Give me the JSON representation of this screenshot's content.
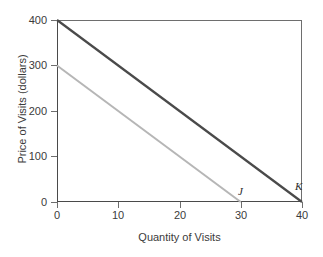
{
  "chart_data": {
    "type": "line",
    "title": "",
    "xlabel": "Quantity of Visits",
    "ylabel": "Price of Visits (dollars)",
    "xlim": [
      0,
      40
    ],
    "ylim": [
      0,
      400
    ],
    "xticks": [
      0,
      10,
      20,
      30,
      40
    ],
    "yticks": [
      0,
      100,
      200,
      300,
      400
    ],
    "xtick_labels": [
      "0",
      "10",
      "20",
      "30",
      "40"
    ],
    "ytick_labels": [
      "0",
      "100",
      "200",
      "300",
      "400"
    ],
    "grid": false,
    "legend": "none",
    "frame": "full-box",
    "series": [
      {
        "name": "K",
        "label": "K",
        "color": "#4a4a4a",
        "width": 2.2,
        "x": [
          0,
          40
        ],
        "y": [
          400,
          0
        ],
        "label_x": 40,
        "label_y": 0,
        "description": "Demand curve K: intercept 400 at quantity 0, reaches 0 at quantity 40"
      },
      {
        "name": "J",
        "label": "J",
        "color": "#b6b6b6",
        "width": 2.0,
        "x": [
          0,
          30
        ],
        "y": [
          300,
          0
        ],
        "label_x": 30,
        "label_y": 0,
        "description": "Demand curve J: intercept 300 at quantity 0, reaches 0 at quantity 30"
      }
    ],
    "annotations": [
      {
        "text": "J",
        "x": 30,
        "y": 0,
        "style": "italic"
      },
      {
        "text": "K",
        "x": 40,
        "y": 0,
        "style": "italic"
      }
    ],
    "colors": {
      "axis": "#6e6e6e",
      "text": "#3b3b3b",
      "background": "#ffffff",
      "series_k": "#4a4a4a",
      "series_j": "#b6b6b6"
    }
  }
}
